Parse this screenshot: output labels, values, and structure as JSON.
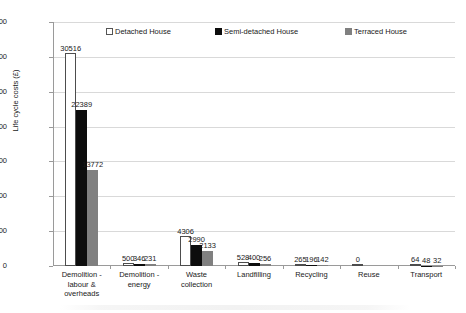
{
  "chart_data": {
    "type": "bar",
    "title": "",
    "xlabel": "",
    "ylabel": "Life cycle costs (£)",
    "ylim": [
      0,
      35000
    ],
    "ytick_step": 5000,
    "ytick_labels": [
      "0",
      "5000",
      "10000",
      "15000",
      "20000",
      "25000",
      "30000",
      "35000"
    ],
    "grid": "horizontal",
    "legend_position": "top-inside",
    "categories": [
      "Demolition - labour & overheads",
      "Demolition - energy",
      "Waste collection",
      "Landfilling",
      "Recycling",
      "Reuse",
      "Transport"
    ],
    "category_lines": [
      [
        "Demolition -",
        "labour &",
        "overheads"
      ],
      [
        "Demolition -",
        "energy"
      ],
      [
        "Waste",
        "collection"
      ],
      [
        "Landfilling"
      ],
      [
        "Recycling"
      ],
      [
        "Reuse"
      ],
      [
        "Transport"
      ]
    ],
    "series": [
      {
        "name": "Detached House",
        "color": "#ffffff",
        "edge_color": "#4d4d4d",
        "values": [
          30516,
          500,
          4306,
          528,
          265,
          0,
          64
        ],
        "labels": [
          "30516",
          "500",
          "4306",
          "528",
          "265",
          "0",
          "64"
        ]
      },
      {
        "name": "Semi-detached House",
        "color": "#0d0d0d",
        "edge_color": "#0d0d0d",
        "values": [
          22389,
          346,
          2990,
          400,
          196,
          0,
          48
        ],
        "labels": [
          "22389",
          "346",
          "2990",
          "400",
          "196",
          "",
          "48"
        ]
      },
      {
        "name": "Terraced House",
        "color": "#808080",
        "edge_color": "#808080",
        "values": [
          13772,
          231,
          2133,
          256,
          142,
          0,
          32
        ],
        "labels": [
          "13772",
          "231",
          "2133",
          "256",
          "142",
          "",
          "32"
        ]
      }
    ]
  },
  "legend": {
    "items": [
      {
        "label": "Detached House",
        "swatch": "legend-swatch-detached"
      },
      {
        "label": "Semi-detached House",
        "swatch": "legend-swatch-semi-detached"
      },
      {
        "label": "Terraced House",
        "swatch": "legend-swatch-terraced"
      }
    ]
  },
  "axis": {
    "y_title": "Life cycle costs (£)"
  }
}
